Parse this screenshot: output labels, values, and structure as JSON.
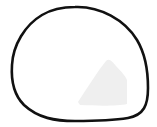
{
  "canvas": {
    "width": 157,
    "height": 127,
    "background": "#ffffff"
  },
  "shape": {
    "name": "closed-blob-outline",
    "stroke": "#111111",
    "stroke_width": 2.6,
    "fill": "none"
  },
  "shaded_region": {
    "name": "light-gray-patch",
    "fill": "#efefef"
  }
}
